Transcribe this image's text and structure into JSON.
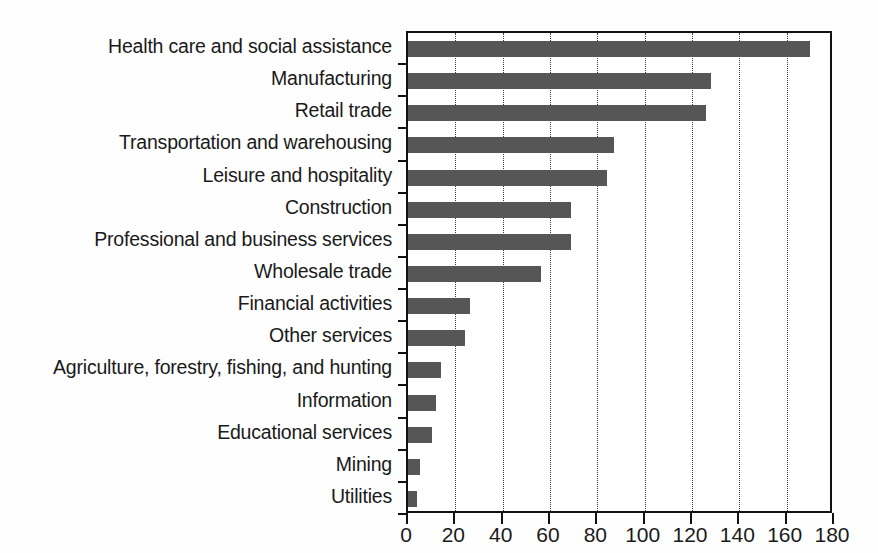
{
  "chart_data": {
    "type": "bar",
    "orientation": "horizontal",
    "title": "",
    "subtitle": "",
    "xlabel": "",
    "ylabel": "",
    "xlim": [
      0,
      180
    ],
    "ylim": null,
    "grid": "vertical-dotted",
    "legend": null,
    "bar_color": "#565656",
    "axis_color": "#111111",
    "background_color": "#ffffff",
    "xticks": [
      0,
      20,
      40,
      60,
      80,
      100,
      120,
      140,
      160,
      180
    ],
    "xticklabels": [
      "0",
      "20",
      "40",
      "60",
      "80",
      "100",
      "120",
      "140",
      "160",
      "180"
    ],
    "categories": [
      "Health care and social assistance",
      "Manufacturing",
      "Retail trade",
      "Transportation and warehousing",
      "Leisure and hospitality",
      "Construction",
      "Professional and business services",
      "Wholesale trade",
      "Financial activities",
      "Other services",
      "Agriculture, forestry, fishing, and hunting",
      "Information",
      "Educational services",
      "Mining",
      "Utilities"
    ],
    "values": [
      170,
      128,
      126,
      87,
      84,
      69,
      69,
      56,
      26,
      24,
      14,
      12,
      10,
      5,
      4
    ]
  }
}
